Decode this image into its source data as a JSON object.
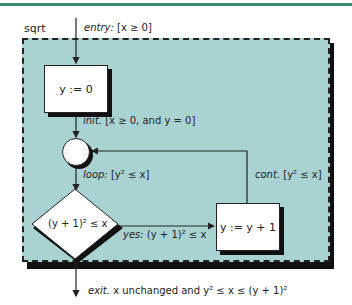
{
  "diagram": {
    "title": "sqrt",
    "colors": {
      "frame_fill": "#a9d3d2",
      "top_rule": "#3a8a72",
      "stroke": "#222222"
    },
    "nodes": {
      "init_box": "y := 0",
      "decision": "(y + 1)² ≤ x",
      "increment_box": "y := y + 1"
    },
    "edges": {
      "entry": {
        "name": "entry:",
        "condition": "[x ≥ 0]"
      },
      "init": {
        "name": "init.",
        "condition": "[x ≥ 0, and y = 0]"
      },
      "loop": {
        "name": "loop:",
        "condition": "[y² ≤ x]"
      },
      "cont": {
        "name": "cont.",
        "condition": "[y² ≤ x]"
      },
      "yes": {
        "name": "yes:",
        "condition": "(y + 1)² ≤ x"
      },
      "exit": {
        "name": "exit.",
        "condition": "x unchanged and y² ≤ x ≤ (y + 1)²"
      }
    }
  }
}
